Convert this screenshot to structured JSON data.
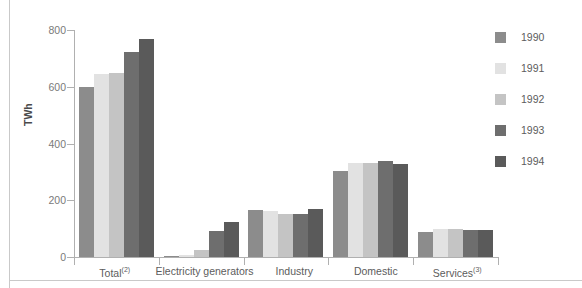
{
  "chart_data": {
    "type": "bar",
    "title": "",
    "xlabel": "",
    "ylabel": "TWh",
    "ylim": [
      0,
      800
    ],
    "yticks": [
      0,
      200,
      400,
      600,
      800
    ],
    "ytick_labels": [
      "0",
      "200",
      "400",
      "600",
      "800"
    ],
    "grid": false,
    "legend_position": "right",
    "categories": [
      "Total",
      "Electricity generators",
      "Industry",
      "Domestic",
      "Services"
    ],
    "category_labels": [
      {
        "text": "Total",
        "superscript": "(2)"
      },
      {
        "text": "Electricity generators",
        "superscript": ""
      },
      {
        "text": "Industry",
        "superscript": ""
      },
      {
        "text": "Domestic",
        "superscript": ""
      },
      {
        "text": "Services",
        "superscript": "(3)"
      }
    ],
    "series": [
      {
        "name": "1990",
        "color": "#8c8c8c",
        "values": [
          600,
          5,
          165,
          302,
          88
        ]
      },
      {
        "name": "1991",
        "color": "#e2e2e2",
        "values": [
          645,
          8,
          162,
          332,
          100
        ]
      },
      {
        "name": "1992",
        "color": "#c4c4c4",
        "values": [
          648,
          25,
          150,
          330,
          100
        ]
      },
      {
        "name": "1993",
        "color": "#6e6e6e",
        "values": [
          722,
          90,
          152,
          340,
          95
        ]
      },
      {
        "name": "1994",
        "color": "#5a5a5a",
        "values": [
          768,
          122,
          168,
          328,
          96
        ]
      }
    ]
  },
  "legend": {
    "entries": [
      {
        "label": "1990",
        "color": "#8c8c8c"
      },
      {
        "label": "1991",
        "color": "#e2e2e2"
      },
      {
        "label": "1992",
        "color": "#c4c4c4"
      },
      {
        "label": "1993",
        "color": "#6e6e6e"
      },
      {
        "label": "1994",
        "color": "#5a5a5a"
      }
    ]
  }
}
